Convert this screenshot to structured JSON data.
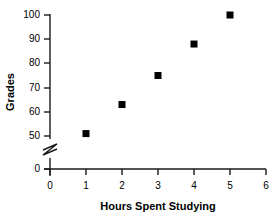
{
  "chart_data": {
    "type": "scatter",
    "title": "",
    "xlabel": "Hours Spent Studying",
    "ylabel": "Grades",
    "x": [
      1,
      2,
      3,
      4,
      5
    ],
    "values": [
      51,
      63,
      75,
      88,
      100
    ],
    "points": [
      {
        "x": 1,
        "y": 51
      },
      {
        "x": 2,
        "y": 63
      },
      {
        "x": 3,
        "y": 75
      },
      {
        "x": 4,
        "y": 88
      },
      {
        "x": 5,
        "y": 100
      }
    ],
    "xlim": [
      0,
      6
    ],
    "ylim": [
      50,
      100
    ],
    "xticks": [
      0,
      1,
      2,
      3,
      4,
      5,
      6
    ],
    "yticks": [
      50,
      60,
      70,
      80,
      90,
      100
    ],
    "y_zero_tick": 0,
    "y_axis_break": true,
    "y_axis_break_between": [
      0,
      50
    ],
    "grid": false,
    "legend": null,
    "marker": "square",
    "marker_color": "#000000",
    "axis_color": "#1a1a1a",
    "background_color": "#ffffff"
  },
  "axis": {
    "x_tick_labels": [
      "0",
      "1",
      "2",
      "3",
      "4",
      "5",
      "6"
    ],
    "y_tick_labels": [
      "50",
      "60",
      "70",
      "80",
      "90",
      "100"
    ],
    "y_zero_label": "0",
    "x_title": "Hours Spent Studying",
    "y_title": "Grades"
  }
}
